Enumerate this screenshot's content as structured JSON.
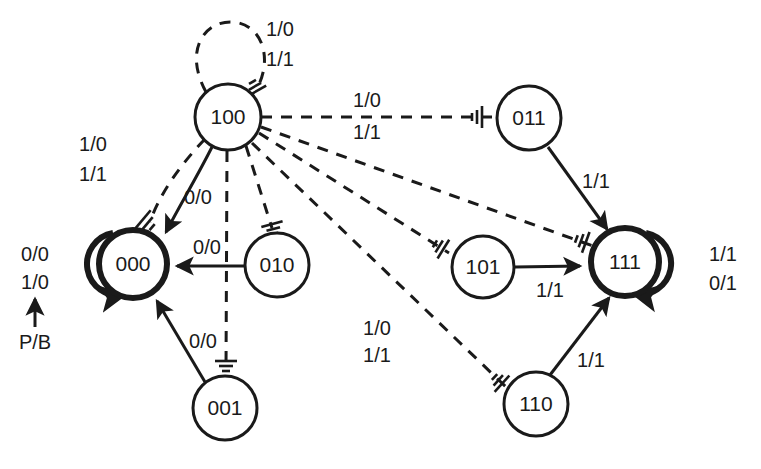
{
  "diagram": {
    "type": "finite-state-machine",
    "colors": {
      "stroke": "#1a1a1a",
      "background": "#ffffff"
    },
    "nodes": [
      {
        "id": "100",
        "label": "100",
        "cx": 228,
        "cy": 117,
        "r": 33,
        "accepting": false
      },
      {
        "id": "000",
        "label": "000",
        "cx": 133,
        "cy": 264,
        "r": 34,
        "accepting": true
      },
      {
        "id": "010",
        "label": "010",
        "cx": 277,
        "cy": 265,
        "r": 32,
        "accepting": false
      },
      {
        "id": "001",
        "label": "001",
        "cx": 225,
        "cy": 408,
        "r": 32,
        "accepting": false
      },
      {
        "id": "011",
        "label": "011",
        "cx": 529,
        "cy": 118,
        "r": 32,
        "accepting": false
      },
      {
        "id": "101",
        "label": "101",
        "cx": 483,
        "cy": 267,
        "r": 31,
        "accepting": false
      },
      {
        "id": "111",
        "label": "111",
        "cx": 625,
        "cy": 262,
        "r": 34,
        "accepting": true
      },
      {
        "id": "110",
        "label": "110",
        "cx": 536,
        "cy": 404,
        "r": 32,
        "accepting": false
      }
    ],
    "edge_labels": [
      {
        "id": "loop-100-a",
        "text": "1/0",
        "x": 280,
        "y": 31
      },
      {
        "id": "loop-100-b",
        "text": "1/1",
        "x": 280,
        "y": 61
      },
      {
        "id": "e100-000-a",
        "text": "1/0",
        "x": 93,
        "y": 146
      },
      {
        "id": "e100-000-b",
        "text": "1/1",
        "x": 93,
        "y": 176
      },
      {
        "id": "e100-000-solid",
        "text": "0/0",
        "x": 198,
        "y": 199
      },
      {
        "id": "e100-011-a",
        "text": "1/0",
        "x": 367,
        "y": 102
      },
      {
        "id": "e100-011-b",
        "text": "1/1",
        "x": 367,
        "y": 134
      },
      {
        "id": "e010-000",
        "text": "0/0",
        "x": 207,
        "y": 249
      },
      {
        "id": "e001-000",
        "text": "0/0",
        "x": 203,
        "y": 343
      },
      {
        "id": "e100-110-a",
        "text": "1/0",
        "x": 377,
        "y": 330
      },
      {
        "id": "e100-110-b",
        "text": "1/1",
        "x": 377,
        "y": 357
      },
      {
        "id": "reset-a",
        "text": "0/0",
        "x": 35,
        "y": 256
      },
      {
        "id": "reset-b",
        "text": "1/0",
        "x": 35,
        "y": 284
      },
      {
        "id": "reset-source",
        "text": "P/B",
        "x": 35,
        "y": 344
      },
      {
        "id": "e011-111",
        "text": "1/1",
        "x": 596,
        "y": 183
      },
      {
        "id": "e101-111",
        "text": "1/1",
        "x": 550,
        "y": 292
      },
      {
        "id": "e110-111",
        "text": "1/1",
        "x": 591,
        "y": 362
      },
      {
        "id": "loop-111-a",
        "text": "1/1",
        "x": 723,
        "y": 256
      },
      {
        "id": "loop-111-b",
        "text": "0/1",
        "x": 723,
        "y": 285
      }
    ],
    "transitions": [
      {
        "from": "100",
        "to": "100",
        "style": "dashed",
        "inputs": [
          "1/0",
          "1/1"
        ]
      },
      {
        "from": "100",
        "to": "000",
        "style": "dashed",
        "inputs": [
          "1/0",
          "1/1"
        ]
      },
      {
        "from": "100",
        "to": "000",
        "style": "solid",
        "inputs": [
          "0/0"
        ]
      },
      {
        "from": "100",
        "to": "011",
        "style": "dashed",
        "inputs": [
          "1/0",
          "1/1"
        ]
      },
      {
        "from": "100",
        "to": "010",
        "style": "dashed",
        "inputs": []
      },
      {
        "from": "100",
        "to": "001",
        "style": "dashed",
        "inputs": []
      },
      {
        "from": "100",
        "to": "101",
        "style": "dashed",
        "inputs": []
      },
      {
        "from": "100",
        "to": "111",
        "style": "dashed",
        "inputs": []
      },
      {
        "from": "100",
        "to": "110",
        "style": "dashed",
        "inputs": [
          "1/0",
          "1/1"
        ]
      },
      {
        "from": "010",
        "to": "000",
        "style": "solid",
        "inputs": [
          "0/0"
        ]
      },
      {
        "from": "001",
        "to": "000",
        "style": "solid",
        "inputs": [
          "0/0"
        ]
      },
      {
        "from": "000",
        "to": "000",
        "style": "solid-thick",
        "inputs": [
          "0/0",
          "1/0"
        ]
      },
      {
        "from": "011",
        "to": "111",
        "style": "solid",
        "inputs": [
          "1/1"
        ]
      },
      {
        "from": "101",
        "to": "111",
        "style": "solid",
        "inputs": [
          "1/1"
        ]
      },
      {
        "from": "110",
        "to": "111",
        "style": "solid",
        "inputs": [
          "1/1"
        ]
      },
      {
        "from": "111",
        "to": "111",
        "style": "solid-thick",
        "inputs": [
          "1/1",
          "0/1"
        ]
      }
    ]
  }
}
